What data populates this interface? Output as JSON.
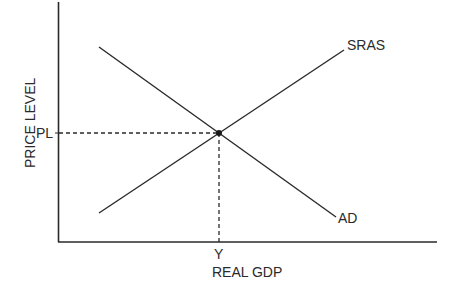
{
  "diagram": {
    "type": "AD-AS model",
    "axes": {
      "x_label": "REAL GDP",
      "y_label": "PRICE LEVEL"
    },
    "curves": [
      {
        "name": "SRAS",
        "label": "SRAS",
        "slope": "upward"
      },
      {
        "name": "AD",
        "label": "AD",
        "slope": "downward"
      }
    ],
    "equilibrium": {
      "price_label": "PL",
      "output_label": "Y"
    },
    "colors": {
      "line": "#2a2a2a",
      "background": "#ffffff"
    }
  }
}
